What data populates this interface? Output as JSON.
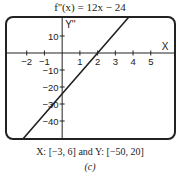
{
  "chart_data": {
    "type": "line",
    "title": "f''(x) = 12x − 24",
    "function": {
      "slope": 12,
      "intercept": -24
    },
    "series": [
      {
        "name": "f''(x)",
        "points": [
          [
            -3,
            -60
          ],
          [
            0,
            -24
          ],
          [
            2,
            0
          ],
          [
            3.667,
            20
          ],
          [
            6,
            48
          ]
        ]
      }
    ],
    "xlim": [
      -3,
      6
    ],
    "ylim": [
      -50,
      20
    ],
    "xlabel": "X",
    "ylabel": "Y''",
    "x_ticks": [
      -2,
      -1,
      1,
      2,
      3,
      4,
      5
    ],
    "x_tick_labels": [
      "−2",
      "−1",
      "1",
      "2",
      "3",
      "4",
      "5"
    ],
    "y_ticks": [
      10,
      -10,
      -20,
      -30,
      -40
    ],
    "y_tick_labels": [
      "10",
      "−10",
      "−20",
      "−30",
      "−40"
    ],
    "grid": false,
    "legend": "none"
  },
  "range_text": "X: [−3, 6] and Y: [−50, 20]",
  "caption": "(c)",
  "colors": {
    "line": "#222222",
    "frame": "#222222",
    "background": "#ffffff"
  }
}
